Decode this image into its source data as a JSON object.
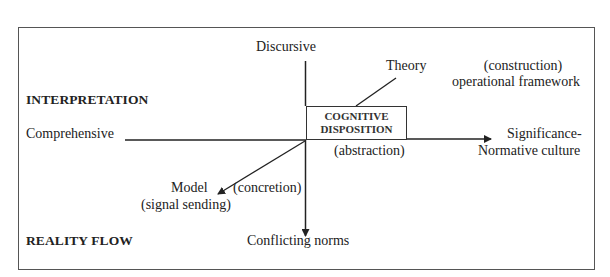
{
  "diagram": {
    "caption_fragment": "Figure 4. The typology of the approach of the cognitive concept (after ...)",
    "axis_labels": {
      "top": "Discursive",
      "bottom": "Conflicting norms",
      "left": "Comprehensive",
      "right_line1": "Significance-",
      "right_line2": "Normative culture"
    },
    "diagonal_labels": {
      "upper_right": "Theory",
      "upper_right_note_line1": "(construction)",
      "upper_right_note_line2": "operational framework",
      "lower_left": "Model",
      "lower_left_note": "(signal sending)",
      "concretion": "(concretion)"
    },
    "center_box": {
      "line1": "COGNITIVE",
      "line2": "DISPOSITION",
      "note": "(abstraction)"
    },
    "section_labels": {
      "upper": "INTERPRETATION",
      "lower": "REALITY FLOW"
    },
    "colors": {
      "line": "#222222",
      "frame": "#555555",
      "background": "#ffffff"
    }
  }
}
